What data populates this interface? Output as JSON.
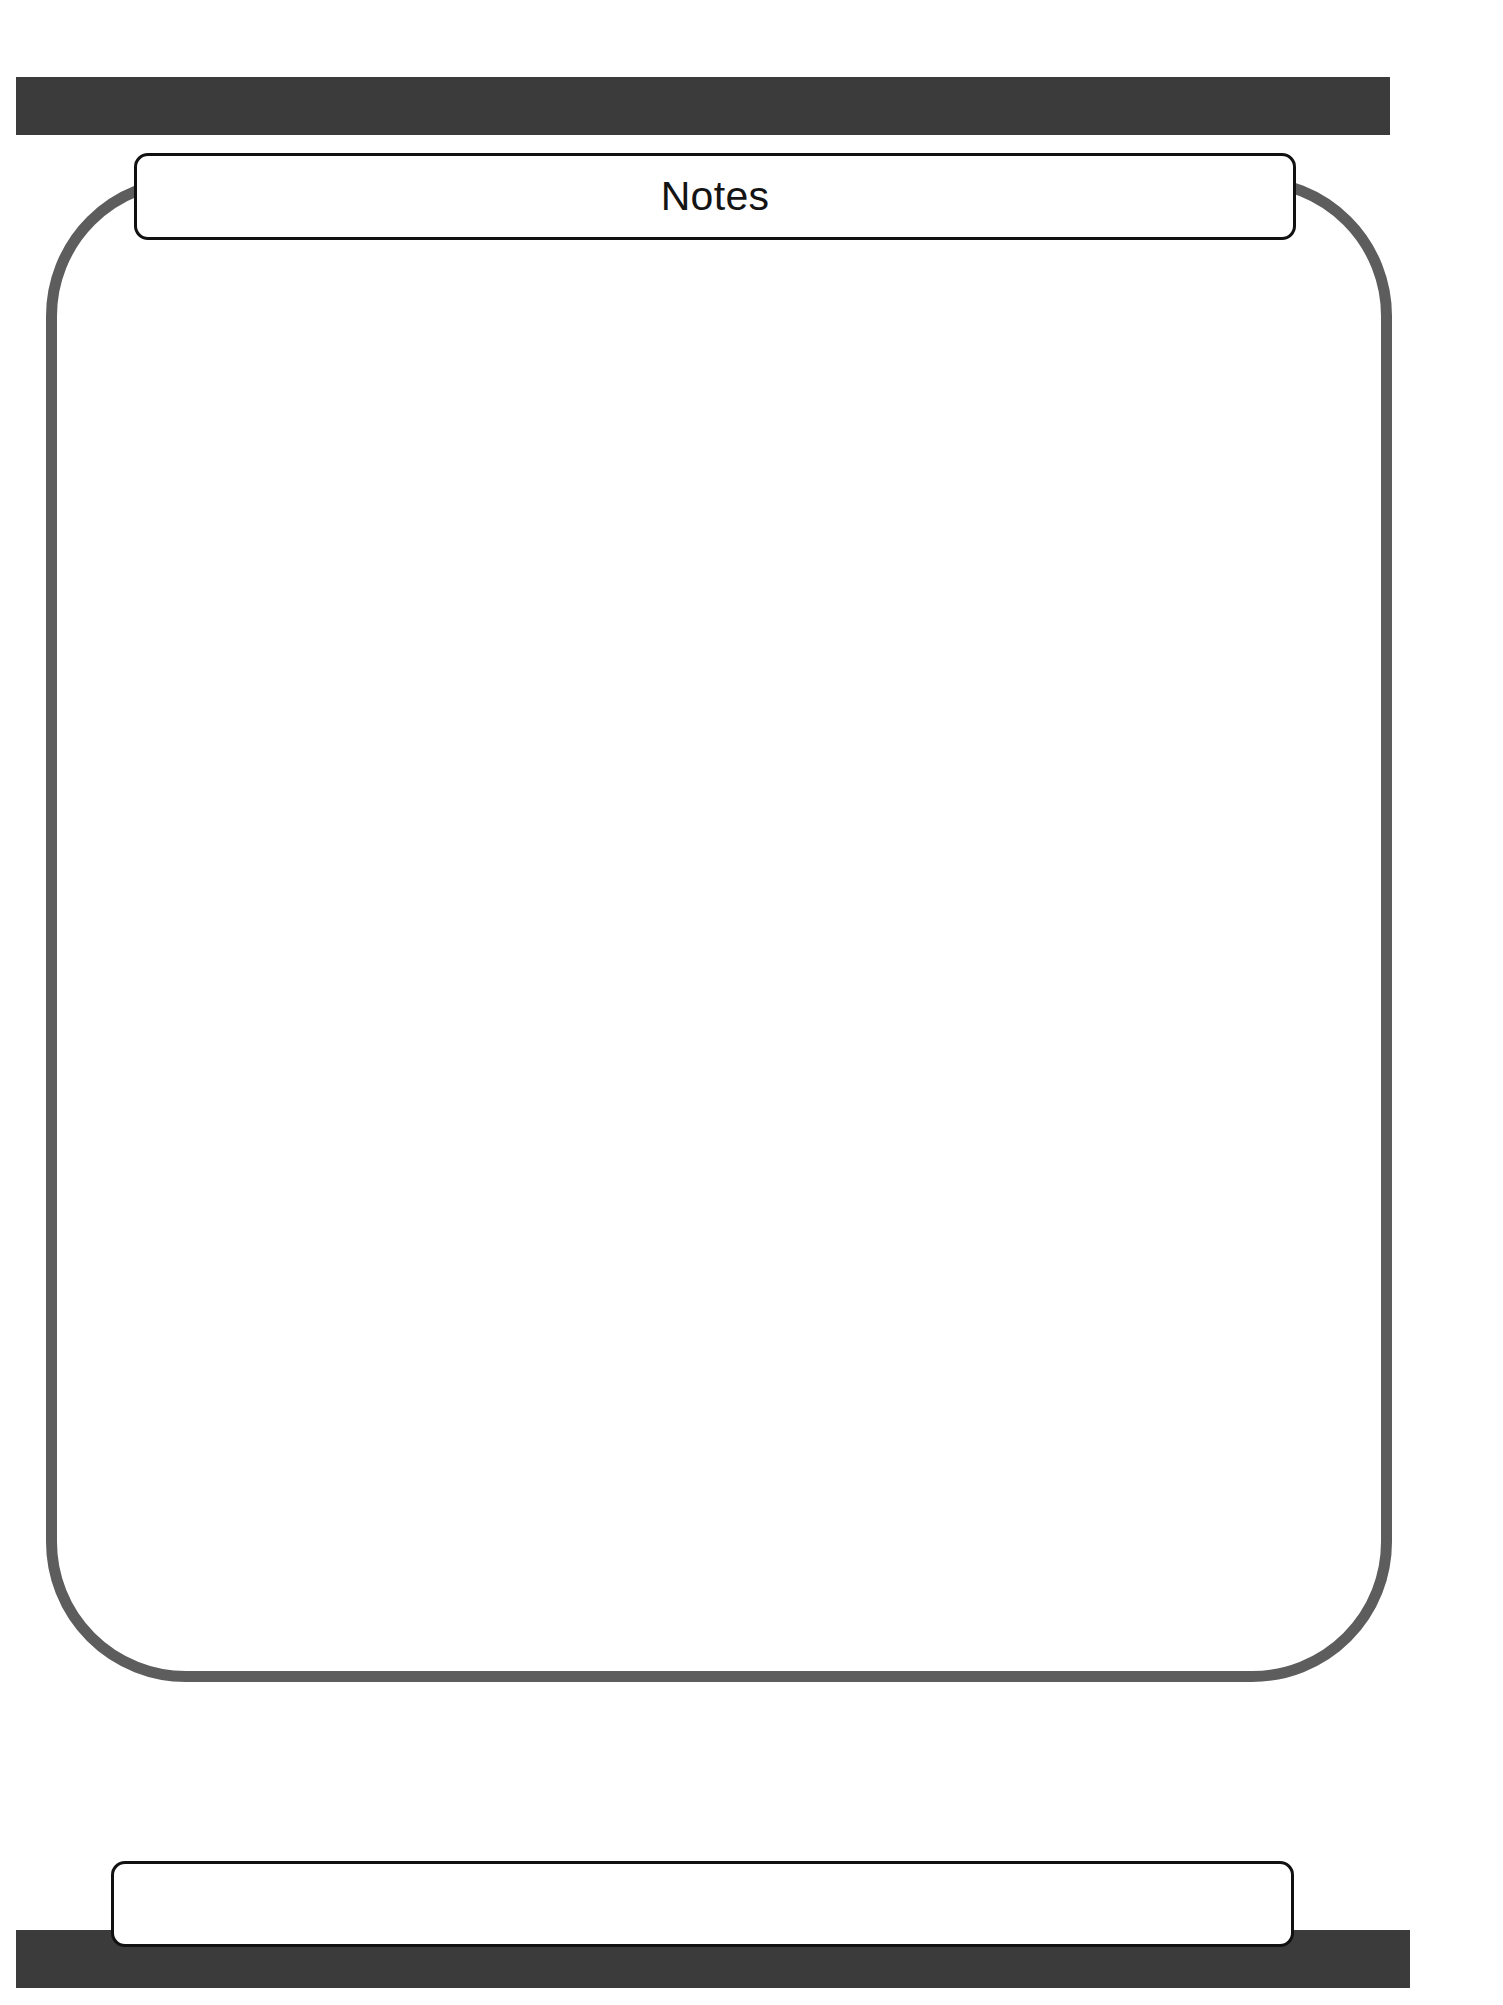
{
  "page": {
    "background_color": "#ffffff",
    "width": 1503,
    "height": 2005
  },
  "colors": {
    "banner_dark": "#3b3b3b",
    "frame_gray": "#5d5d5d",
    "border_black": "#111111",
    "text": "#141414",
    "surface_white": "#ffffff"
  },
  "header": {
    "bar_label": "",
    "title": "Notes"
  },
  "note_area": {
    "content": "",
    "placeholder": ""
  },
  "footer": {
    "box_label": "",
    "bar_label": ""
  }
}
